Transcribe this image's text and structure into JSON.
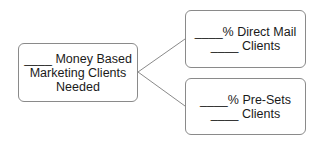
{
  "diagram": {
    "root": {
      "lines": [
        "____ Money Based",
        "Marketing Clients",
        "Needed"
      ]
    },
    "children": [
      {
        "lines": [
          "____% Direct Mail",
          "____ Clients"
        ]
      },
      {
        "lines": [
          "____% Pre-Sets",
          "____ Clients"
        ]
      }
    ],
    "colors": {
      "border": "#8a8a8a",
      "connector": "#8a8a8a",
      "text": "#1a1a1a"
    }
  }
}
